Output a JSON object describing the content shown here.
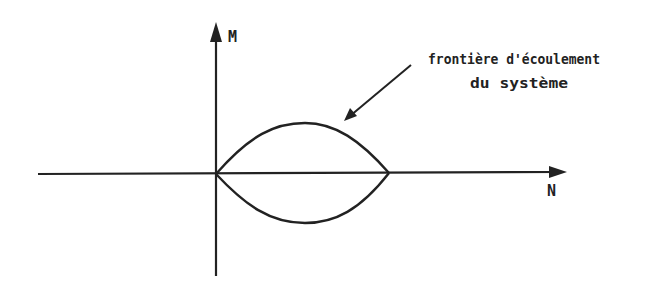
{
  "diagram": {
    "axes": {
      "vertical_label": "M",
      "horizontal_label": "N"
    },
    "annotation": {
      "line1": "frontière d'écoulement",
      "line2": "du système"
    },
    "colors": {
      "ink": "#222222",
      "background": "#ffffff"
    }
  }
}
